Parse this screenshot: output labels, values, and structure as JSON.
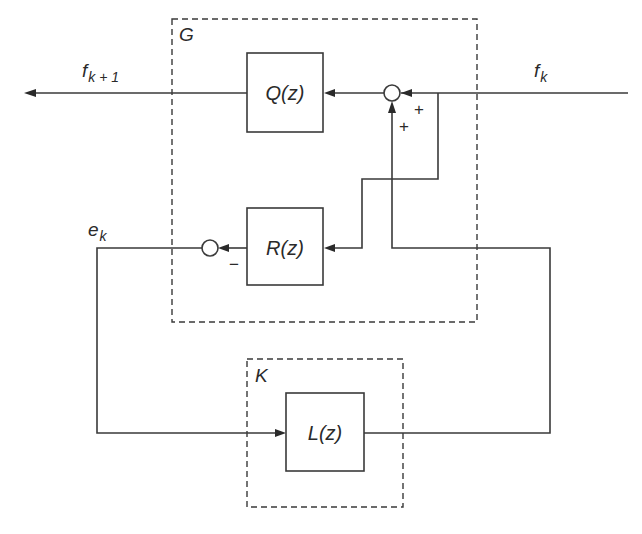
{
  "diagram": {
    "type": "block-diagram",
    "groups": {
      "G": {
        "label": "G"
      },
      "K": {
        "label": "K"
      }
    },
    "blocks": {
      "Q": {
        "label": "Q(z)"
      },
      "R": {
        "label": "R(z)"
      },
      "L": {
        "label": "L(z)"
      }
    },
    "signals": {
      "f_k": {
        "base": "f",
        "sub": "k"
      },
      "f_k1": {
        "base": "f",
        "sub": "k + 1"
      },
      "e_k": {
        "base": "e",
        "sub": "k"
      }
    },
    "summing_junctions": {
      "top": {
        "signs": [
          "+",
          "+"
        ]
      },
      "bottom": {
        "signs": [
          "−"
        ]
      }
    },
    "connections": [
      "f_k -> top_sum (+)",
      "f_k branch -> R(z)",
      "top_sum -> Q(z)",
      "Q(z) -> f_k+1",
      "R(z) -> bottom_sum (−)",
      "bottom_sum -> e_k",
      "e_k -> L(z)",
      "L(z) -> top_sum (+)"
    ]
  }
}
